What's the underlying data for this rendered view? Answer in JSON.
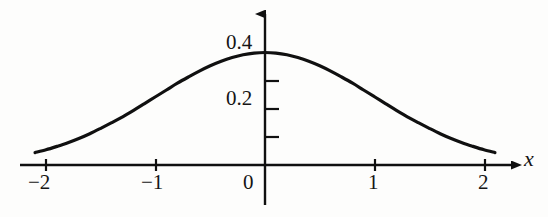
{
  "figure": {
    "background_color": "#fdfdfc",
    "ink_color": "#101010",
    "width": 548,
    "height": 217
  },
  "axes": {
    "x_axis_label": "x",
    "y_axis_label": "",
    "x_ticks": [
      {
        "value": -2,
        "label": "−2"
      },
      {
        "value": -1,
        "label": "−1"
      },
      {
        "value": 0,
        "label": "0"
      },
      {
        "value": 1,
        "label": "1"
      },
      {
        "value": 2,
        "label": "2"
      }
    ],
    "y_ticks": [
      {
        "value": 0.1,
        "label": ""
      },
      {
        "value": 0.2,
        "label": "0.2"
      },
      {
        "value": 0.3,
        "label": ""
      },
      {
        "value": 0.4,
        "label": "0.4"
      }
    ],
    "x_arrow": "right",
    "y_arrow": "up"
  },
  "chart_data": {
    "type": "line",
    "title": "",
    "subtitle": "",
    "xlabel": "x",
    "ylabel": "",
    "xlim": [
      -2.15,
      2.15
    ],
    "ylim": [
      0,
      0.45
    ],
    "grid": false,
    "legend": null,
    "annotations": [],
    "series": [
      {
        "name": "standard normal density",
        "formula": "f(x) = (1/sqrt(2*pi)) * exp(-x^2/2)",
        "x": [
          -2.1,
          -2.0,
          -1.9,
          -1.8,
          -1.7,
          -1.6,
          -1.5,
          -1.4,
          -1.3,
          -1.2,
          -1.1,
          -1.0,
          -0.9,
          -0.8,
          -0.7,
          -0.6,
          -0.5,
          -0.4,
          -0.3,
          -0.2,
          -0.1,
          0.0,
          0.1,
          0.2,
          0.3,
          0.4,
          0.5,
          0.6,
          0.7,
          0.8,
          0.9,
          1.0,
          1.1,
          1.2,
          1.3,
          1.4,
          1.5,
          1.6,
          1.7,
          1.8,
          1.9,
          2.0,
          2.1
        ],
        "y": [
          0.044,
          0.054,
          0.066,
          0.079,
          0.094,
          0.111,
          0.13,
          0.15,
          0.171,
          0.194,
          0.218,
          0.242,
          0.266,
          0.29,
          0.312,
          0.333,
          0.352,
          0.368,
          0.381,
          0.391,
          0.397,
          0.399,
          0.397,
          0.391,
          0.381,
          0.368,
          0.352,
          0.333,
          0.312,
          0.29,
          0.266,
          0.242,
          0.218,
          0.194,
          0.171,
          0.15,
          0.13,
          0.111,
          0.094,
          0.079,
          0.066,
          0.054,
          0.044
        ]
      }
    ]
  }
}
